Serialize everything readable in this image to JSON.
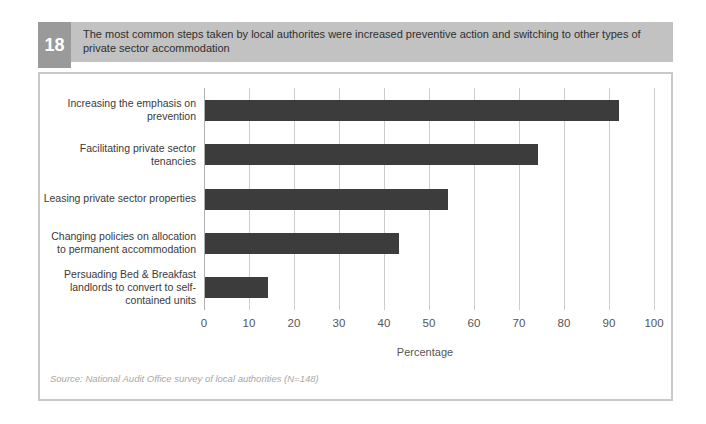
{
  "header": {
    "number": "18",
    "title_lines": [
      "The most common steps taken by local authorites were increased preventive action and switching to other types of",
      "private sector accommodation"
    ]
  },
  "chart_data": {
    "type": "bar",
    "orientation": "horizontal",
    "title": "The most common steps taken by local authorites were increased preventive action and switching to other types of private sector accommodation",
    "categories": [
      "Increasing the emphasis on prevention",
      "Facilitating private sector tenancies",
      "Leasing private sector properties",
      "Changing policies on allocation to permanent accommodation",
      "Persuading Bed & Breakfast landlords to convert to self-contained units"
    ],
    "values": [
      92,
      74,
      54,
      43,
      14
    ],
    "xlabel": "Percentage",
    "ylabel": "",
    "xlim": [
      0,
      100
    ],
    "xticks": [
      0,
      10,
      20,
      30,
      40,
      50,
      60,
      70,
      80,
      90,
      100
    ],
    "grid": true,
    "legend": "none",
    "bar_color": "#3c3c3c"
  },
  "footer": {
    "source": "Source: National Audit Office survey of local authorities (N=148)"
  },
  "colors": {
    "header_band": "#c2c2c2",
    "number_box": "#9a9a9a",
    "number_text": "#ffffff",
    "title_text": "#2f2f2f",
    "bar": "#3c3c3c",
    "gridline": "#cccccc",
    "chart_border": "#c9c9c9",
    "category_text": "#3a3a3a",
    "tick_text": "#555555",
    "source_text": "#a8a8a8",
    "background": "#ffffff"
  }
}
